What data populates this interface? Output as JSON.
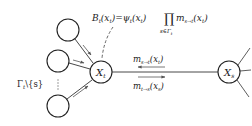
{
  "diagram": {
    "type": "factor-graph message passing",
    "nodes": {
      "xt": {
        "label": "X",
        "sub": "t",
        "cx": 101,
        "cy": 72
      },
      "xs": {
        "label": "X",
        "sub": "s",
        "cx": 229,
        "cy": 72
      },
      "neighbors": [
        {
          "cx": 68,
          "cy": 30
        },
        {
          "cx": 58,
          "cy": 61
        },
        {
          "cx": 58,
          "cy": 106
        }
      ]
    },
    "belief_label": {
      "lhs": "B",
      "lhs_sub": "t",
      "lhs_arg": "(x",
      "lhs_arg_sub": "t",
      "close": ")",
      "eq": "=",
      "psi": "ψ",
      "psi_sub": "t",
      "prod": "∏",
      "prod_under": "s∈Γ",
      "prod_under_sub": "t",
      "m": "m",
      "m_sub": "s→t"
    },
    "neighbor_set_label": {
      "text": "Γ",
      "sub": "t",
      "rest": "\\{s}"
    },
    "msg_top": {
      "m": "m",
      "sub": "s→t",
      "arg": "(x",
      "arg_sub": "t",
      "close": ")"
    },
    "msg_bottom": {
      "m": "m",
      "sub": "t→s",
      "arg": "(x",
      "arg_sub": "s",
      "close": ")"
    },
    "colors": {
      "stroke": "#222222",
      "arrow": "#555555",
      "bg": "#ffffff"
    }
  }
}
